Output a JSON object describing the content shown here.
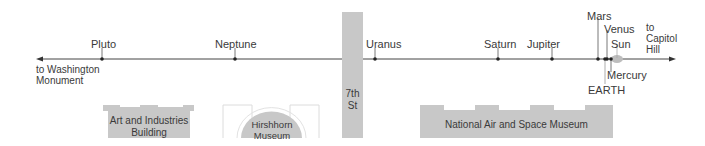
{
  "diagram": {
    "left_destination": {
      "line1": "to Washington",
      "line2": "Monument"
    },
    "right_destination": {
      "line1": "to",
      "line2": "Capitol",
      "line3": "Hill"
    },
    "planets": [
      {
        "name": "Pluto",
        "x": 102
      },
      {
        "name": "Neptune",
        "x": 235
      },
      {
        "name": "Uranus",
        "x": 375
      },
      {
        "name": "Saturn",
        "x": 498
      },
      {
        "name": "Jupiter",
        "x": 552
      },
      {
        "name": "Mars",
        "x": 598
      },
      {
        "name": "EARTH",
        "x": 605
      },
      {
        "name": "Venus",
        "x": 608
      },
      {
        "name": "Mercury",
        "x": 611
      },
      {
        "name": "Sun",
        "x": 616
      }
    ],
    "street": {
      "line1": "7th",
      "line2": "St"
    },
    "buildings": [
      {
        "name_line1": "Art and Industries",
        "name_line2": "Building"
      },
      {
        "name_line1": "Hirshhorn",
        "name_line2": "Museum"
      },
      {
        "name_line1": "National Air and Space Museum"
      }
    ],
    "colors": {
      "building_fill": "#c8c8c8",
      "line": "#333333",
      "sun_glow": "#bdbdbd",
      "outline": "#dddddd"
    }
  }
}
